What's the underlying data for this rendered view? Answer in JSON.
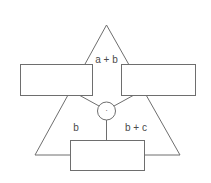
{
  "diagram": {
    "shape": "triangle-with-operator-node",
    "labels": {
      "top": "a + b",
      "left": "b",
      "right": "b + c"
    },
    "operator": {
      "symbol": "·",
      "shape": "circle"
    },
    "boxes": [
      {
        "id": "left-box",
        "text": ""
      },
      {
        "id": "right-box",
        "text": ""
      },
      {
        "id": "bottom-box",
        "text": ""
      }
    ],
    "colors": {
      "stroke": "#6e6e6e",
      "text": "#4a4a4a",
      "background": "#ffffff"
    }
  }
}
